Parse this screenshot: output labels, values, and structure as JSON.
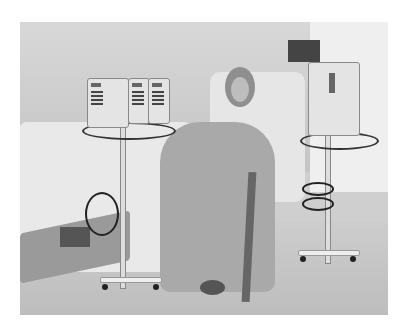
{
  "image": {
    "description": "Grayscale photo of a patient in a hospital gown sitting in a chair beside a hospital bed, with IV infusion pumps on wheeled poles on either side",
    "palette": {
      "background": "#ffffff",
      "wall": "#d0d0d0",
      "bed": "#e9e9e9",
      "gown": "#a9a9a9",
      "equipment": "#e4e4e4",
      "dark": "#222222"
    },
    "objects": [
      "hospital-bed",
      "patient",
      "recliner-chair",
      "iv-pump-cluster-left",
      "iv-pump-right",
      "iv-pole-left",
      "iv-pole-right",
      "wall-monitor",
      "window"
    ]
  }
}
